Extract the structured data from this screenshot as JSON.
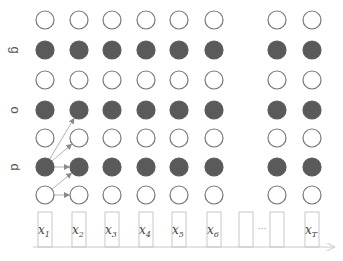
{
  "diagram": {
    "row_labels": [
      {
        "text": "g",
        "row": 1
      },
      {
        "text": "o",
        "row": 3
      },
      {
        "text": "d",
        "row": 5
      }
    ],
    "columns": [
      {
        "label": "x",
        "sub": "1",
        "x": 45
      },
      {
        "label": "x",
        "sub": "2",
        "x": 79
      },
      {
        "label": "x",
        "sub": "3",
        "x": 112
      },
      {
        "label": "x",
        "sub": "4",
        "x": 146
      },
      {
        "label": "x",
        "sub": "5",
        "x": 179
      },
      {
        "label": "x",
        "sub": "6",
        "x": 214
      },
      {
        "label": "",
        "sub": "",
        "x": 246,
        "empty": true
      },
      {
        "label": "",
        "sub": "",
        "x": 277,
        "empty": true
      },
      {
        "label": "x",
        "sub": "T",
        "x": 312
      }
    ],
    "ellipsis": "···",
    "rows_y": [
      20,
      50,
      80,
      110,
      138,
      167,
      195
    ],
    "row_filled": [
      false,
      true,
      false,
      true,
      false,
      true,
      false
    ],
    "circle_columns": [
      45,
      79,
      112,
      146,
      179,
      214,
      277,
      312
    ],
    "arrows": [
      {
        "from": [
          0,
          5
        ],
        "to": [
          1,
          3
        ]
      },
      {
        "from": [
          0,
          5
        ],
        "to": [
          1,
          4
        ]
      },
      {
        "from": [
          0,
          5
        ],
        "to": [
          1,
          5
        ]
      },
      {
        "from": [
          0,
          6
        ],
        "to": [
          1,
          5
        ]
      },
      {
        "from": [
          0,
          6
        ],
        "to": [
          1,
          6
        ]
      }
    ],
    "colors": {
      "filled": "#5a5a5a",
      "hollow_stroke": "#777777",
      "arrow": "#b0b0b0",
      "box_stroke": "#c8c8c8",
      "axis": "#c8c8c8"
    }
  }
}
